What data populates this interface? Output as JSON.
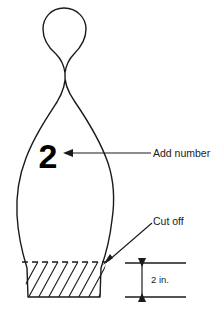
{
  "diagram": {
    "background_color": "#ffffff",
    "line_color": "#1a1a1a",
    "pin": {
      "name": "bowling-pin",
      "number_label": "2",
      "number_color": "#000000"
    },
    "annotations": [
      {
        "id": "add-number",
        "label": "Add number",
        "target": "pin-number",
        "arrow": "left"
      },
      {
        "id": "cut-off",
        "label": "Cut off",
        "target": "cut-line",
        "arrow": "down-left"
      }
    ],
    "dimension": {
      "id": "base-height",
      "label": "2 in.",
      "value": 2,
      "unit": "in.",
      "orientation": "vertical"
    },
    "cut_region": {
      "id": "hatched-base",
      "style": "diagonal-hatch",
      "line_style": "dashed"
    }
  }
}
